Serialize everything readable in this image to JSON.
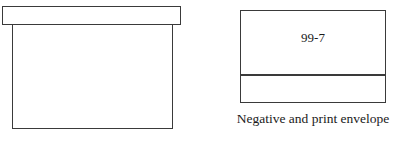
{
  "background_color": "#ffffff",
  "stroke_color": "#3a3a3a",
  "text_color": "#1a1a1a",
  "figures": [
    {
      "name": "shoe-box",
      "number_label": "99",
      "caption": "Shoe box",
      "parts": [
        "lid",
        "body"
      ]
    },
    {
      "name": "negative-and-print-envelope",
      "number_label": "99-7",
      "caption": "Negative and print envelope",
      "parts": [
        "upper-panel",
        "lower-panel"
      ]
    }
  ],
  "shoebox": {
    "number": "99",
    "caption": "Shoe box"
  },
  "envelope": {
    "number": "99-7",
    "caption": "Negative and print envelope"
  }
}
